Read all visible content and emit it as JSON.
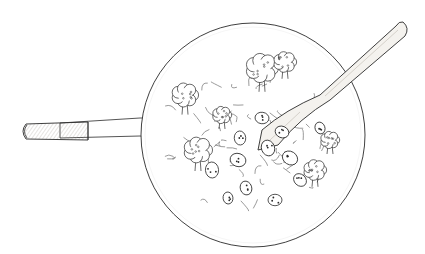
{
  "illustration": {
    "title": "Wok with stir-fry and wooden spatula",
    "description": "Pen-and-ink line drawing, top-down view of a round wok with a long handle on the left, filled with stir-fried broccoli, sliced vegetables and noodles, with a wooden spatula extending to the upper right.",
    "style": "black line art on white",
    "colors": {
      "background": "#ffffff",
      "ink": "#2a2a2a",
      "light_ink": "#7a7a7a",
      "wood_shade": "#d9d4cc"
    },
    "parts": [
      "wok-rim",
      "wok-handle",
      "handle-grip",
      "rivets",
      "spatula",
      "broccoli",
      "vegetable-slices",
      "noodles"
    ]
  }
}
